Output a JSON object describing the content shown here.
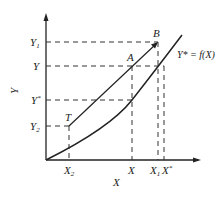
{
  "diagram": {
    "axes": {
      "x_label": "X",
      "y_label": "Y"
    },
    "y_ticks": [
      {
        "label": "Y",
        "sub": "1",
        "y": 42
      },
      {
        "label": "Y",
        "sub": "",
        "y": 66
      },
      {
        "label": "Y",
        "sup": "*",
        "y": 100
      },
      {
        "label": "Y",
        "sub": "2",
        "y": 126
      }
    ],
    "x_ticks": [
      {
        "label": "X",
        "sub": "2",
        "x": 69
      },
      {
        "label": "X",
        "sub": "",
        "x": 132
      },
      {
        "label": "X",
        "sub": "1",
        "x": 158
      },
      {
        "label": "X",
        "sup": "*",
        "x": 164
      }
    ],
    "points": {
      "B": "B",
      "A": "A",
      "T": "T"
    },
    "curve_label": "Y* = f(X)",
    "colors": {
      "line": "#222222",
      "background": "#ffffff"
    }
  }
}
